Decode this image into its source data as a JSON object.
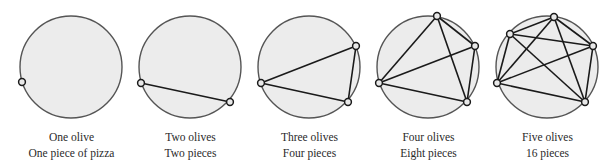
{
  "colors": {
    "pizza_fill": "#ececec",
    "pizza_stroke": "#555555",
    "chord": "#1a1a1a",
    "olive_fill": "#e8e8e8",
    "olive_stroke": "#1a1a1a",
    "text": "#2a2a2a"
  },
  "circle": {
    "radius": 51,
    "cy": 67
  },
  "panels": [
    {
      "cx": 71,
      "caption_line1": "One olive",
      "caption_line2": "One piece of pizza",
      "olives": [
        [
          22,
          82
        ]
      ]
    },
    {
      "cx": 190,
      "caption_line1": "Two olives",
      "caption_line2": "Two pieces",
      "olives": [
        [
          141,
          83
        ],
        [
          230,
          102
        ]
      ]
    },
    {
      "cx": 309,
      "caption_line1": "Three olives",
      "caption_line2": "Four pieces",
      "olives": [
        [
          261,
          83
        ],
        [
          356,
          46
        ],
        [
          348,
          102
        ]
      ]
    },
    {
      "cx": 428,
      "caption_line1": "Four olives",
      "caption_line2": "Eight pieces",
      "olives": [
        [
          379,
          83
        ],
        [
          437,
          16
        ],
        [
          475,
          46
        ],
        [
          467,
          102
        ]
      ]
    },
    {
      "cx": 547,
      "caption_line1": "Five olives",
      "caption_line2": "16 pieces",
      "olives": [
        [
          497,
          83
        ],
        [
          510,
          34
        ],
        [
          554,
          17
        ],
        [
          593,
          46
        ],
        [
          585,
          102
        ]
      ]
    }
  ]
}
